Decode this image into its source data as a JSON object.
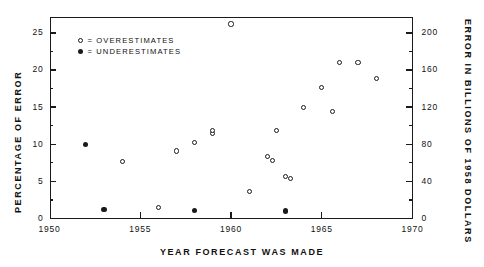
{
  "chart_data": {
    "type": "scatter",
    "title": "",
    "xlabel": "YEAR FORECAST WAS MADE",
    "ylabel": "PERCENTAGE OF ERROR",
    "ylabel_right": "ERROR IN BILLIONS OF 1958 DOLLARS",
    "xlim": [
      1950,
      1970
    ],
    "ylim": [
      0,
      27.2
    ],
    "ylim_right": [
      0,
      217.6
    ],
    "xticks": [
      1950,
      1955,
      1960,
      1965,
      1970
    ],
    "xtick_labels": [
      "1950",
      "1955",
      "1960",
      "1965",
      "1970"
    ],
    "xminor_step": 1,
    "yticks": [
      0,
      5,
      10,
      15,
      20,
      25
    ],
    "ytick_labels": [
      "0",
      "5",
      "10",
      "15",
      "20",
      "25"
    ],
    "yminor_step": 2.5,
    "yticks_right": [
      0,
      40,
      80,
      120,
      160,
      200
    ],
    "ytick_labels_right": [
      "0",
      "40",
      "80",
      "120",
      "160",
      "200"
    ],
    "yminor_step_right": 20,
    "grid": false,
    "legend_position": "upper-left-inside",
    "legend": [
      {
        "key": "over",
        "marker": "open-circle",
        "label": "= OVERESTIMATES"
      },
      {
        "key": "under",
        "marker": "filled-circle",
        "label": "= UNDERESTIMATES"
      }
    ],
    "series": [
      {
        "name": "OVERESTIMATES",
        "marker": "open-circle",
        "points": [
          {
            "x": 1954.0,
            "y": 7.7
          },
          {
            "x": 1956.0,
            "y": 1.5
          },
          {
            "x": 1957.0,
            "y": 9.1
          },
          {
            "x": 1958.0,
            "y": 10.2
          },
          {
            "x": 1959.0,
            "y": 11.4
          },
          {
            "x": 1959.0,
            "y": 11.8
          },
          {
            "x": 1960.0,
            "y": 26.2
          },
          {
            "x": 1961.0,
            "y": 3.6
          },
          {
            "x": 1962.0,
            "y": 8.3
          },
          {
            "x": 1962.3,
            "y": 7.8
          },
          {
            "x": 1962.5,
            "y": 11.8
          },
          {
            "x": 1963.0,
            "y": 5.6
          },
          {
            "x": 1963.3,
            "y": 5.4
          },
          {
            "x": 1964.0,
            "y": 15.0
          },
          {
            "x": 1965.0,
            "y": 17.6
          },
          {
            "x": 1965.6,
            "y": 14.4
          },
          {
            "x": 1966.0,
            "y": 21.0
          },
          {
            "x": 1967.0,
            "y": 21.0
          },
          {
            "x": 1968.0,
            "y": 18.8
          }
        ]
      },
      {
        "name": "UNDERESTIMATES",
        "marker": "filled-circle",
        "points": [
          {
            "x": 1952.0,
            "y": 10.0
          },
          {
            "x": 1953.0,
            "y": 1.2
          },
          {
            "x": 1958.0,
            "y": 1.1
          },
          {
            "x": 1963.0,
            "y": 1.0
          }
        ]
      }
    ]
  },
  "axes": {
    "left_title": "PERCENTAGE OF ERROR",
    "right_title": "ERROR IN BILLIONS OF 1958 DOLLARS",
    "bottom_title": "YEAR FORECAST WAS MADE"
  },
  "legend": {
    "over_label": "= OVERESTIMATES",
    "under_label": "= UNDERESTIMATES"
  },
  "colors": {
    "ink": "#1a1a1a",
    "background": "#ffffff"
  }
}
